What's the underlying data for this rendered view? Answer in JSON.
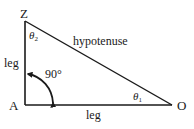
{
  "diagram": {
    "vertices": [
      {
        "id": "Z",
        "label": "Z",
        "x": 25,
        "y": 21
      },
      {
        "id": "A",
        "label": "A",
        "x": 25,
        "y": 105
      },
      {
        "id": "O",
        "label": "O",
        "x": 172,
        "y": 105
      }
    ],
    "sides": {
      "vertical_leg": "leg",
      "horizontal_leg": "leg",
      "hypotenuse": "hypotenuse"
    },
    "angles": {
      "theta1": {
        "symbol": "θ",
        "subscript": "1",
        "at": "O"
      },
      "theta2": {
        "symbol": "θ",
        "subscript": "2",
        "at": "Z"
      },
      "right_angle": {
        "label": "90°",
        "at": "A"
      }
    },
    "colors": {
      "stroke": "#1a1a1a",
      "background": "#ffffff"
    }
  }
}
